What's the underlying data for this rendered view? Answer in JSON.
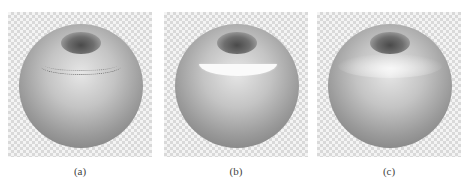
{
  "figure": {
    "panels": [
      {
        "id": "a",
        "label": "(a)",
        "description": "sphere with hole on top, dotted crescent selection outline"
      },
      {
        "id": "b",
        "label": "(b)",
        "description": "sphere with hole on top, white filled crescent selection"
      },
      {
        "id": "c",
        "label": "(c)",
        "description": "sphere with hole on top, soft highlighted band"
      }
    ],
    "background": "checkerboard transparency pattern",
    "colors": {
      "checker_light": "#f4f4f4",
      "checker_dark": "#d9d9d9",
      "sphere_mid": "#a0a0a0"
    }
  }
}
